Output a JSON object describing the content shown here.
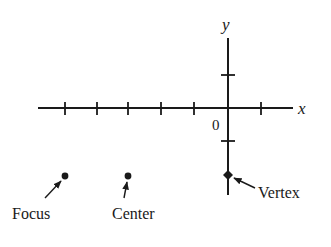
{
  "diagram": {
    "type": "coordinate-plane-conic",
    "axes": {
      "x_label": "x",
      "y_label": "y",
      "origin_label": "0",
      "x_ticks": [
        -5,
        -4,
        -3,
        -2,
        -1,
        0,
        1
      ],
      "y_ticks": [
        1,
        -1,
        -2
      ]
    },
    "points": [
      {
        "id": "focus",
        "label": "Focus",
        "x": -5,
        "y": -2
      },
      {
        "id": "center",
        "label": "Center",
        "x": -3,
        "y": -2
      },
      {
        "id": "vertex",
        "label": "Vertex",
        "x": 0,
        "y": -2
      }
    ],
    "colors": {
      "ink": "#1a1a1a",
      "background": "#ffffff"
    }
  }
}
